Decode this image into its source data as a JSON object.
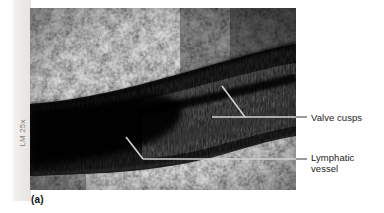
{
  "figure": {
    "panel_letter": "(a)",
    "magnification_credit": "LM 25x",
    "background_color": "#ffffff"
  },
  "micrograph": {
    "description": "light micrograph of a lymphatic vessel with valve cusps surrounded by adipose tissue",
    "modality": "LM",
    "magnification": "25x",
    "frame": {
      "x": 30,
      "y": 8,
      "width": 266,
      "height": 182
    }
  },
  "annotations": [
    {
      "id": "valve-cusps",
      "label": "Valve cusps",
      "label_x": 311,
      "label_y": 112,
      "leader_color": "#cfcfcf",
      "leader_tail_color": "#4a4a4a",
      "leader": {
        "diagonal_start_x": 222,
        "diagonal_start_y": 86,
        "elbow_x": 245,
        "elbow_y": 117,
        "horizontal_left_x": 212,
        "horizontal_right_x": 305
      }
    },
    {
      "id": "lymphatic-vessel",
      "label": "Lymphatic\nvessel",
      "label_x": 311,
      "label_y": 152,
      "leader_color": "#cfcfcf",
      "leader_tail_color": "#4a4a4a",
      "leader": {
        "diagonal_start_x": 126,
        "diagonal_start_y": 137,
        "elbow_x": 143,
        "elbow_y": 159,
        "horizontal_left_x": 143,
        "horizontal_right_x": 305
      }
    }
  ],
  "colors": {
    "page_strip": "#eceae6",
    "credit_text": "#7e7d79",
    "label_text": "#1b1b1b",
    "leader_light": "#cfcfcf",
    "leader_dark": "#4a4a4a",
    "micrograph_dark": "#0a0a0a",
    "micrograph_bright": "#f2f2f2"
  }
}
